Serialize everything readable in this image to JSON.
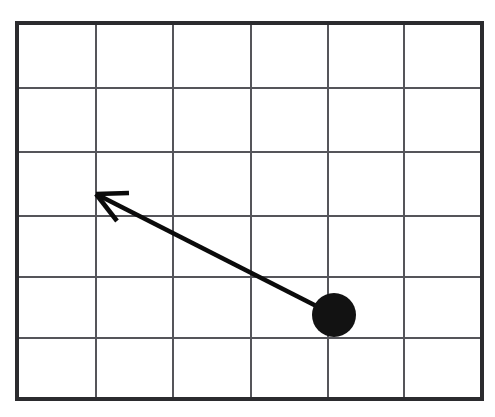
{
  "figure": {
    "canvas": {
      "width": 495,
      "height": 417,
      "background": "#ffffff"
    }
  },
  "grid": {
    "name": "background-grid",
    "columns": 6,
    "rows": 6,
    "cell_width_px": 77.5,
    "cell_height_px": 62.7,
    "bounds": {
      "left": 17,
      "top": 23,
      "right": 482,
      "bottom": 399
    },
    "x_positions": [
      17,
      96,
      173,
      251,
      328,
      404,
      482
    ],
    "y_positions": [
      23,
      88,
      152,
      216,
      277,
      338,
      399
    ],
    "line_color": "#55555a",
    "border_color": "#2b2b2e",
    "line_width_px": 2,
    "border_width_px": 3,
    "labels": [],
    "tick_labels": []
  },
  "ball": {
    "name": "black-ball",
    "center_px": {
      "x": 334,
      "y": 315
    },
    "radius_px": 22,
    "color": "#121212",
    "grid_cell": {
      "column": 5,
      "row": 5
    }
  },
  "vector": {
    "name": "velocity-arrow",
    "tail_px": {
      "x": 334,
      "y": 315
    },
    "tip_px": {
      "x": 96,
      "y": 194
    },
    "delta_px": {
      "x": -238,
      "y": -121
    },
    "direction": "up and to the left",
    "color": "#0b0b0b",
    "line_width_px": 5,
    "arrowhead": {
      "upper_barb_end_px": {
        "x": 129,
        "y": 193
      },
      "lower_barb_end_px": {
        "x": 117,
        "y": 221
      }
    }
  },
  "chart_data": {
    "type": "scatter",
    "title": "",
    "xlabel": "",
    "ylabel": "",
    "grid": true,
    "legend": "none",
    "xlim": [
      0,
      6
    ],
    "ylim": [
      0,
      6
    ],
    "xticks": [
      0,
      1,
      2,
      3,
      4,
      5,
      6
    ],
    "yticks": [
      0,
      1,
      2,
      3,
      4,
      5,
      6
    ],
    "xticklabels": [
      "",
      "",
      "",
      "",
      "",
      "",
      ""
    ],
    "yticklabels": [
      "",
      "",
      "",
      "",
      "",
      "",
      ""
    ],
    "annotations": [
      {
        "kind": "point",
        "label": "ball",
        "x": 4.09,
        "y": 1.34,
        "marker": "filled-circle",
        "color": "#121212"
      },
      {
        "kind": "arrow",
        "label": "velocity vector",
        "x_start": 4.09,
        "y_start": 1.34,
        "x_end": 1.02,
        "y_end": 3.27,
        "dx": -3.07,
        "dy": 1.93,
        "color": "#0b0b0b"
      }
    ]
  }
}
